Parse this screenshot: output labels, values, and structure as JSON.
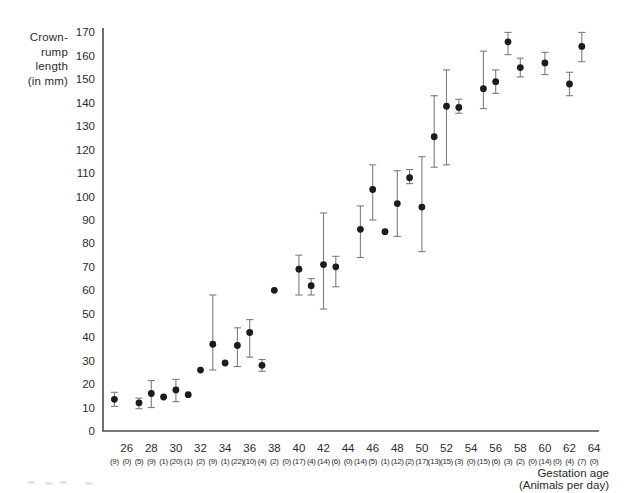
{
  "figure": {
    "y_axis_title_lines": [
      "Crown-",
      "rump",
      "length",
      "(in mm)"
    ],
    "x_axis_title_lines": [
      "Gestation age",
      "(Animals per day)"
    ],
    "colors": {
      "marker": "#1c1c1c",
      "error_bar": "#7d7d7d",
      "axis": "#4a4a4a",
      "tick_label": "#2b2b2b"
    }
  },
  "chart_data": {
    "type": "scatter",
    "title": "",
    "xlabel": "Gestation age (Animals per day)",
    "ylabel": "Crown-rump length (in mm)",
    "xlim": [
      24,
      65
    ],
    "ylim": [
      0,
      170
    ],
    "grid": false,
    "error_bars": true,
    "legend": "none",
    "x_tick_labels": [
      26,
      28,
      30,
      32,
      34,
      36,
      38,
      40,
      42,
      44,
      46,
      48,
      50,
      52,
      54,
      56,
      58,
      60,
      62,
      64
    ],
    "y_ticks": [
      0,
      10,
      20,
      30,
      40,
      50,
      60,
      70,
      80,
      90,
      100,
      110,
      120,
      130,
      140,
      150,
      160,
      170
    ],
    "points": [
      {
        "day": 25,
        "n": 9,
        "mean": 13.5,
        "lo": 10.5,
        "hi": 16.5
      },
      {
        "day": 26,
        "n": 0
      },
      {
        "day": 27,
        "n": 5,
        "mean": 12,
        "lo": 9.5,
        "hi": 14
      },
      {
        "day": 28,
        "n": 9,
        "mean": 16,
        "lo": 10,
        "hi": 21.5
      },
      {
        "day": 29,
        "n": 1,
        "mean": 14.5
      },
      {
        "day": 30,
        "n": 20,
        "mean": 17.5,
        "lo": 12.5,
        "hi": 22
      },
      {
        "day": 31,
        "n": 1,
        "mean": 15.5
      },
      {
        "day": 32,
        "n": 2,
        "mean": 26
      },
      {
        "day": 33,
        "n": 9,
        "mean": 37,
        "lo": 26,
        "hi": 58
      },
      {
        "day": 34,
        "n": 1,
        "mean": 29
      },
      {
        "day": 35,
        "n": 22,
        "mean": 36.5,
        "lo": 27.5,
        "hi": 44
      },
      {
        "day": 36,
        "n": 10,
        "mean": 42,
        "lo": 31.5,
        "hi": 47.5
      },
      {
        "day": 37,
        "n": 4,
        "mean": 28,
        "lo": 25.5,
        "hi": 30.5
      },
      {
        "day": 38,
        "n": 2,
        "mean": 60
      },
      {
        "day": 39,
        "n": 0
      },
      {
        "day": 40,
        "n": 17,
        "mean": 69,
        "lo": 58,
        "hi": 75
      },
      {
        "day": 41,
        "n": 4,
        "mean": 62,
        "lo": 58,
        "hi": 65
      },
      {
        "day": 42,
        "n": 14,
        "mean": 71,
        "lo": 52,
        "hi": 93
      },
      {
        "day": 43,
        "n": 6,
        "mean": 70,
        "lo": 61.5,
        "hi": 74.5
      },
      {
        "day": 44,
        "n": 0
      },
      {
        "day": 45,
        "n": 14,
        "mean": 86,
        "lo": 74,
        "hi": 96
      },
      {
        "day": 46,
        "n": 5,
        "mean": 103,
        "lo": 90,
        "hi": 113.5
      },
      {
        "day": 47,
        "n": 1,
        "mean": 85
      },
      {
        "day": 48,
        "n": 12,
        "mean": 97,
        "lo": 83,
        "hi": 111
      },
      {
        "day": 49,
        "n": 2,
        "mean": 108,
        "lo": 105.5,
        "hi": 111.5
      },
      {
        "day": 50,
        "n": 17,
        "mean": 95.5,
        "lo": 76.5,
        "hi": 117
      },
      {
        "day": 51,
        "n": 13,
        "mean": 125.5,
        "lo": 112.5,
        "hi": 143
      },
      {
        "day": 52,
        "n": 15,
        "mean": 138.5,
        "lo": 113.5,
        "hi": 154
      },
      {
        "day": 53,
        "n": 3,
        "mean": 138,
        "lo": 135.5,
        "hi": 141.5
      },
      {
        "day": 54,
        "n": 0
      },
      {
        "day": 55,
        "n": 15,
        "mean": 146,
        "lo": 137.5,
        "hi": 162
      },
      {
        "day": 56,
        "n": 6,
        "mean": 149,
        "lo": 144,
        "hi": 154
      },
      {
        "day": 57,
        "n": 3,
        "mean": 166,
        "lo": 160.5,
        "hi": 170
      },
      {
        "day": 58,
        "n": 2,
        "mean": 155,
        "lo": 151,
        "hi": 159
      },
      {
        "day": 59,
        "n": 0
      },
      {
        "day": 60,
        "n": 14,
        "mean": 157,
        "lo": 152,
        "hi": 161.5
      },
      {
        "day": 61,
        "n": 0
      },
      {
        "day": 62,
        "n": 4,
        "mean": 148,
        "lo": 143,
        "hi": 153
      },
      {
        "day": 63,
        "n": 7,
        "mean": 164,
        "lo": 157.5,
        "hi": 170
      },
      {
        "day": 64,
        "n": 0
      }
    ]
  }
}
